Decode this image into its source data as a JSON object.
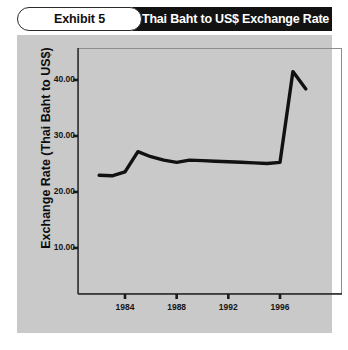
{
  "exhibit": {
    "label": "Exhibit 5"
  },
  "header": {
    "title": "Thai Baht to US$ Exchange Rate"
  },
  "colors": {
    "panel_background": "#c9c9c9",
    "title_bar": "#121212",
    "title_text": "#ffffff",
    "line": "#111111",
    "frame": "#8d8d8d",
    "page_background": "#ffffff"
  },
  "chart_data": {
    "type": "line",
    "title": "Thai Baht to US$ Exchange Rate",
    "xlabel": "",
    "ylabel": "Exchange Rate (Thai Baht to US$)",
    "xlim": [
      1982,
      1998
    ],
    "ylim": [
      0,
      45
    ],
    "grid": false,
    "legend": null,
    "x_tick_labels": [
      "1984",
      "1988",
      "1992",
      "1996"
    ],
    "x_ticks": [
      1984,
      1988,
      1992,
      1996
    ],
    "y_tick_labels": [
      "10.00",
      "20.00",
      "30.00",
      "40.00"
    ],
    "y_ticks": [
      10,
      20,
      30,
      40
    ],
    "series": [
      {
        "name": "Thai Baht per US$",
        "x": [
          1982,
          1983,
          1984,
          1985,
          1986,
          1987,
          1988,
          1989,
          1990,
          1991,
          1992,
          1993,
          1994,
          1995,
          1996,
          1997,
          1998
        ],
        "values": [
          23.0,
          22.9,
          23.6,
          27.2,
          26.3,
          25.7,
          25.3,
          25.7,
          25.6,
          25.5,
          25.4,
          25.3,
          25.2,
          25.1,
          25.3,
          41.5,
          38.4
        ]
      }
    ]
  }
}
